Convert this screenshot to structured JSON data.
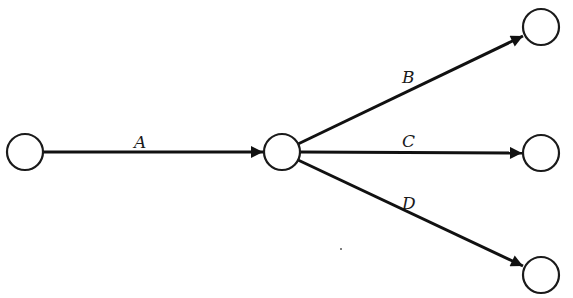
{
  "diagram": {
    "type": "activity-on-arrow network",
    "nodes": [
      {
        "id": "n1",
        "cx": 25,
        "cy": 152,
        "r": 18
      },
      {
        "id": "n2",
        "cx": 282,
        "cy": 152,
        "r": 18
      },
      {
        "id": "n3",
        "cx": 541,
        "cy": 27,
        "r": 18
      },
      {
        "id": "n4",
        "cx": 541,
        "cy": 153,
        "r": 18
      },
      {
        "id": "n5",
        "cx": 541,
        "cy": 275,
        "r": 18
      }
    ],
    "edges": [
      {
        "id": "A",
        "label": "A",
        "from": "n1",
        "to": "n2",
        "label_x": 134,
        "label_y": 148
      },
      {
        "id": "B",
        "label": "B",
        "from": "n2",
        "to": "n3",
        "label_x": 402,
        "label_y": 83
      },
      {
        "id": "C",
        "label": "C",
        "from": "n2",
        "to": "n4",
        "label_x": 402,
        "label_y": 147
      },
      {
        "id": "D",
        "label": "D",
        "from": "n2",
        "to": "n5",
        "label_x": 402,
        "label_y": 209
      }
    ],
    "colors": {
      "stroke": "#111111",
      "background": "#ffffff"
    }
  }
}
